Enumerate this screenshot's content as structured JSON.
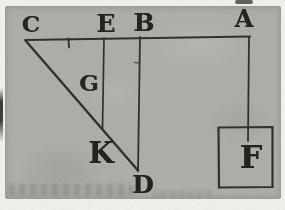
{
  "figure": {
    "labels": {
      "C": "C",
      "E": "E",
      "B": "B",
      "A": "A",
      "G": "G",
      "K": "K",
      "D": "D",
      "F": "F"
    }
  },
  "colors": {
    "paper": "#b1b1ab",
    "page_edge": "#f3f3ef",
    "ink_lines": "#32322c",
    "ink_text": "#24241f"
  }
}
